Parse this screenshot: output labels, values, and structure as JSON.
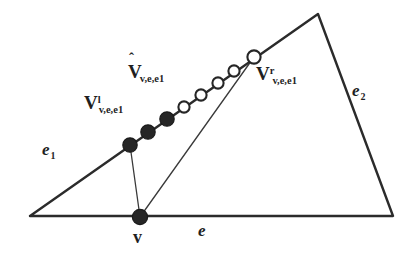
{
  "figure": {
    "type": "geometry-diagram",
    "width": 413,
    "height": 255,
    "background_color": "#ffffff",
    "line_color": "#2b2b2b",
    "dot_fill_color": "#262626",
    "circle_stroke_color": "#262626",
    "circle_fill_color": "#ffffff"
  },
  "polygon": {
    "name": "outer-polygon",
    "points": "30,216 318,14 393,216 30,216",
    "vertices": [
      {
        "name": "bottom-left",
        "x": 30,
        "y": 216
      },
      {
        "name": "apex",
        "x": 318,
        "y": 14
      },
      {
        "name": "bottom-right",
        "x": 393,
        "y": 216
      }
    ]
  },
  "rays": [
    {
      "name": "ray-v-to-vl",
      "x1": 140,
      "y1": 217,
      "x2": 130,
      "y2": 145
    },
    {
      "name": "ray-v-to-vr",
      "x1": 140,
      "y1": 217,
      "x2": 254,
      "y2": 57
    }
  ],
  "samples": {
    "filled_points": [
      {
        "name": "v-left",
        "x": 130,
        "y": 145,
        "r": 7.2
      },
      {
        "name": "sample-2",
        "x": 148,
        "y": 132,
        "r": 7.2
      },
      {
        "name": "sample-3",
        "x": 167,
        "y": 119,
        "r": 7.2
      }
    ],
    "hollow_points": [
      {
        "name": "sample-4",
        "x": 184,
        "y": 107,
        "r": 5.6
      },
      {
        "name": "sample-5",
        "x": 201,
        "y": 95,
        "r": 5.6
      },
      {
        "name": "sample-6",
        "x": 218,
        "y": 83,
        "r": 5.6
      },
      {
        "name": "sample-7",
        "x": 234,
        "y": 71,
        "r": 5.6
      },
      {
        "name": "v-right",
        "x": 254,
        "y": 57,
        "r": 6.6
      }
    ]
  },
  "labels": {
    "v_left": {
      "base": "V",
      "superscript": "l",
      "subscript": "v,e,e1"
    },
    "v_hat": {
      "hat": "ˆ",
      "base": "V",
      "subscript": "v,e,e1"
    },
    "v_right": {
      "base": "V",
      "superscript": "r",
      "subscript": "v,e,e1"
    },
    "edge_e1": {
      "base": "e",
      "subscript": "1"
    },
    "edge_e2": {
      "base": "e",
      "subscript": "2"
    },
    "edge_e": {
      "base": "e"
    },
    "vertex_v": {
      "base": "v"
    }
  }
}
